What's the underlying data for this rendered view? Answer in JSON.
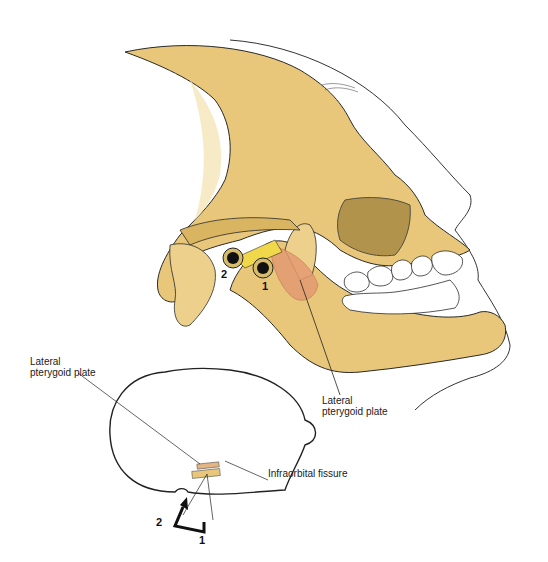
{
  "figure": {
    "type": "anatomical-illustration"
  },
  "labels": {
    "lateral_pterygoid_plate_main_line1": "Lateral",
    "lateral_pterygoid_plate_main_line2": "pterygoid plate",
    "lateral_pterygoid_plate_inset_line1": "Lateral",
    "lateral_pterygoid_plate_inset_line2": "pterygoid plate",
    "infraorbital_fissure": "Infraorbital fissure"
  },
  "markers": {
    "main_1": "1",
    "main_2": "2",
    "inset_1": "1",
    "inset_2": "2"
  },
  "colors": {
    "bone": "#e8c77a",
    "bone_light": "#f3dea6",
    "bone_shadow": "#c9a24e",
    "muscle": "#e39a72",
    "outline": "#2a2a2a",
    "nerve_yellow": "#f0d84a"
  }
}
